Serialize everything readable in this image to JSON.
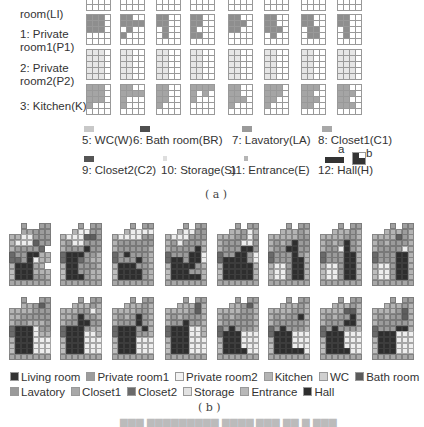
{
  "part_a": {
    "row_labels": [
      "room(LI)",
      "1: Private\nroom1(P1)",
      "2: Private\nroom2(P2)",
      "3: Kitchen(K)"
    ],
    "row_colors": [
      "#3a3a3a",
      "#8e8e8e",
      "#e6e6e6",
      "#a5a5a5"
    ],
    "grids": [
      [
        "XXXX....",
        "XX..X...",
        "XX..XXX.",
        "XXX..XX.",
        "XX..XXX.",
        "XXXX.X..",
        "XXX..XX.",
        "XXX..X.."
      ],
      [
        "XXX.XXX.XXX.....",
        "XX..XXXX.X..X...",
        "XX..XX...X...X..",
        "XX..XX..X...XX..",
        "XX..XXX.XX......",
        "XX..XX..XXX..X..",
        "XX..XX...XX..XX.",
        "XX..XX...X...X.."
      ],
      [
        "XXX.XXX.XXX.XXX.XXX.",
        "XX..XX..XX..XX..XX..",
        "XX..XX..XX..XX..XX..",
        "XX..XX..XX..XX..XX..",
        "XX..XX..XX..XX..XX..",
        "XX..XX..XX..XX..XX..",
        "XX..XX..XX..XX..XX..",
        "XXX.XXX.XXX.XXX.XXX."
      ],
      [
        "XXX.XXX.XXX.X.......",
        "XX..XXXXX...X.......",
        "XX..XX..XX..X.......",
        "XXXXX.X.X...........",
        "XX..XX..XXX.X.......",
        "XXX.XXX.XX..X.......",
        "XXX.XX..XXX.XX......",
        "XX..XXX.XX..XXX....."
      ]
    ],
    "legend": [
      {
        "label": "5: WC(W)",
        "color": "#c8c8c8"
      },
      {
        "label": "6: Bath room(BR)",
        "color": "#4f4f4f"
      },
      {
        "label": "7: Lavatory(LA)",
        "color": "#9a9a9a"
      },
      {
        "label": "8: Closet1(C1)",
        "color": "#a8a8a8"
      },
      {
        "label": "9: Closet2(C2)",
        "color": "#555555"
      },
      {
        "label": "10: Storage(S)",
        "color": "#dedede"
      },
      {
        "label": "11: Entrance(E)",
        "color": "#b5b5b5"
      },
      {
        "label": "12: Hall(H)",
        "color": "#333333"
      }
    ],
    "hall_variants": [
      "a",
      "b"
    ],
    "sublabel": "( a )"
  },
  "part_b": {
    "plans": [
      [
        "..#..##",
        "..LLPP#",
        "KKWWPPP",
        "KWWWBPP",
        "KPPPPC.",
        "CPPHHKK",
        "CCPHWKK",
        "KHHHLK.",
        "EHHHKKK",
        "EHHHPPK",
        "LLLLLLL"
      ],
      [
        "...#.##",
        "..KWWP#",
        "KWWWBBP",
        "KPWWPPP",
        "KPPPHPP",
        "CHHHPPK",
        "CHHCPKK",
        "KHHPPPK",
        "EHHPPKK",
        "EHHHPKK",
        "LLLLLLL"
      ],
      [
        "...#.##",
        "..KWWWW",
        "KWWWWPP",
        "KPPPPPP",
        "KPPPPPK",
        "CPHPPPK",
        "CPPPHPK",
        "KHHHPPK",
        "EHHHHPK",
        "EHHHHPK",
        "LLLLLLL"
      ],
      [
        "...#.##",
        "..KWWPP",
        "KWWWPPP",
        "KPWPPPK",
        "KPPPPHK",
        "CPPPHHW",
        "CHHPHHW",
        "KHHHHPK",
        "EHHHPPK",
        "EHHHHHK",
        "LLLLLLL"
      ],
      [
        "...#.##",
        "..KKPWK",
        "KKKPPWP",
        "KPPPWWP",
        "KPPPHHP",
        "CPPHHPW",
        "CHHHHPW",
        "KHHHHHK",
        "EHHHHHK",
        "EHHHHHK",
        "LLLLLLL"
      ],
      [
        "...#.##",
        "..KKKPK",
        "KKKKKPP",
        "KPKPHPP",
        "KPPHHPP",
        "CPPPHPK",
        "CPPPHHK",
        "KWWPHHK",
        "EWWPHHK",
        "EWWPHHK",
        "LLLLLLL"
      ],
      [
        "...#.##",
        "..KKKPK",
        "KKKKPPK",
        "KPKPHPK",
        "KPPWHPK",
        "CPPPHHK",
        "CPPPHHK",
        "KWWPHHK",
        "EWWPHHK",
        "EWWPHHK",
        "LLLLLLL"
      ],
      [
        "...#.##",
        "..KKKPK",
        "KKKKBPK",
        "KPKPPPK",
        "KPPPPWK",
        "CPPPHHK",
        "CPPPHHK",
        "KWWPHHK",
        "EWWPHHK",
        "EWWPHHK",
        "LLLLLLL"
      ],
      [
        "..#..##",
        "..KKPB#",
        "KKKKPPP",
        "KKPPPPP",
        "KPPKKKP",
        "CHHHWPP",
        "CHHHWKK",
        "KHHHWWW",
        "EHHHWWW",
        "EHHHWWW",
        "LLLLLLL"
      ],
      [
        "...#.##",
        "..KKKPK",
        "KKKPPWK",
        "KKPHPPK",
        "KPPHHPP",
        "CHHHPKK",
        "CHHHWWK",
        "KHHHWWW",
        "EHHHWWW",
        "EHHHWWW",
        "LLLLLLL"
      ],
      [
        "...#.##",
        "..KKKPK",
        "KKKKPPK",
        "KPKPHPK",
        "KPPPHPK",
        "CHHHPHK",
        "CHHHPPK",
        "KHHHWWW",
        "EHHHWWW",
        "EHHHWWW",
        "LLLLLLL"
      ],
      [
        "...#.##",
        "..KKKBK",
        "KKKKPBK",
        "KPKPPPK",
        "KPPHPPK",
        "CHHHWWK",
        "CHHHWWK",
        "KHHHWWW",
        "EHHHWWW",
        "EHHHWWW",
        "LLLLLLL"
      ],
      [
        "...#.##",
        "..KKPBK",
        "KKKKPPK",
        "KPKPPPK",
        "KPPPPPK",
        "CPHPPPK",
        "CHHHWWW",
        "KHHHWWW",
        "EHHHWWW",
        "EHHHHWW",
        "LLLLLLL"
      ],
      [
        "...#.##",
        "..KKKPK",
        "KKKKPPK",
        "KPKPPHK",
        "KPPPPPK",
        "CPHPPPK",
        "CHHHWWW",
        "KHHHWWW",
        "EHHHWWW",
        "EHHHHHW",
        "LLLLLLL"
      ],
      [
        "...#.##",
        "..KKKPK",
        "KKKKBBK",
        "KPKPPHK",
        "KPPPHHK",
        "CPHPPPK",
        "CHHHWWW",
        "KHHHWWW",
        "EHHHWWW",
        "EHHHHWW",
        "LLLLLLL"
      ],
      [
        "...#.##",
        "..KKKPK",
        "KKKKPBK",
        "KPKPPBK",
        "KPPPPPK",
        "CPPPHHK",
        "CHHHWWW",
        "KHHHWWW",
        "EHHHWWW",
        "EHHHWWW",
        "LLLLLLL"
      ]
    ],
    "cell_colors": {
      "H": "#2e2e2e",
      "P": "#9c9c9c",
      "W": "#eeeeee",
      "K": "#b4b4b4",
      "B": "#5e5e5e",
      "C": "#6a6a6a",
      "L": "#a8a8a8",
      "E": "#bdbdbd",
      "#": "#a0a0a0"
    },
    "legend": [
      {
        "label": "Living room",
        "color": "#333333"
      },
      {
        "label": "Private room1",
        "color": "#9c9c9c"
      },
      {
        "label": "Private room2",
        "color": "#f2f2f2"
      },
      {
        "label": "Kitchen",
        "color": "#b4b4b4"
      },
      {
        "label": "WC",
        "color": "#d0d0d0"
      },
      {
        "label": "Bath room",
        "color": "#5a5a5a"
      },
      {
        "label": "Lavatory",
        "color": "#9a9a9a"
      },
      {
        "label": "Closet1",
        "color": "#a8a8a8"
      },
      {
        "label": "Closet2",
        "color": "#6a6a6a"
      },
      {
        "label": "Storage",
        "color": "#e2e2e2"
      },
      {
        "label": "Entrance",
        "color": "#b8b8b8"
      },
      {
        "label": "Hall",
        "color": "#2e2e2e"
      }
    ],
    "sublabel": "( b )"
  }
}
